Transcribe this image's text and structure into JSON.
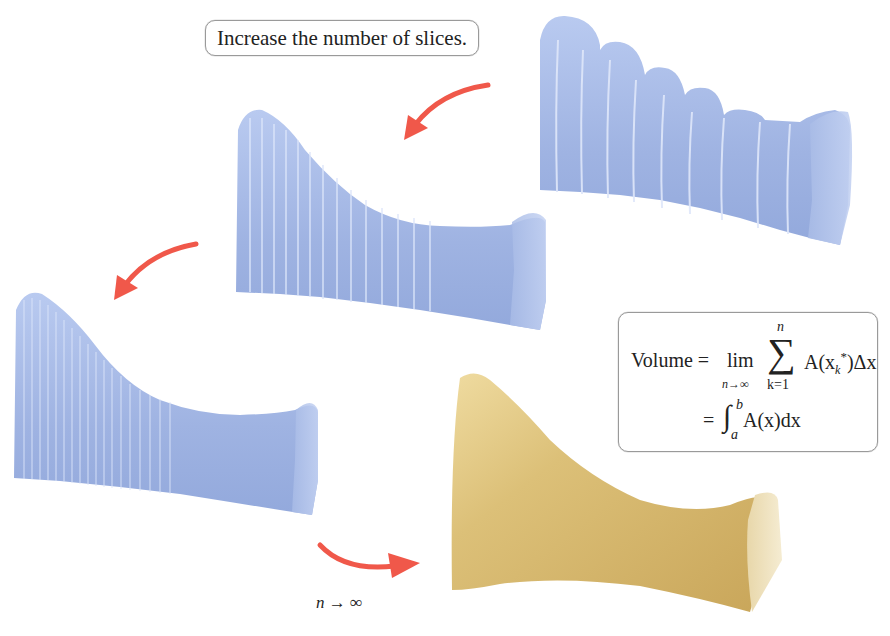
{
  "diagram": {
    "callout_top": {
      "text": "Increase the number of slices."
    },
    "formula": {
      "lhs": "Volume",
      "equals": "=",
      "lim": "lim",
      "lim_sub": "n→∞",
      "sigma": "∑",
      "sum_upper": "n",
      "sum_lower": "k=1",
      "summand": "A(x",
      "summand_sub": "k",
      "summand_sup": "*",
      "summand_tail": ")Δx",
      "line2_equals": "=",
      "integral": "∫",
      "int_upper": "b",
      "int_lower": "a",
      "integrand": "A(x)dx"
    },
    "limit_label": "n → ∞",
    "solids": [
      {
        "id": "solid-few-slices",
        "slices": 10,
        "color": "#a9bde8"
      },
      {
        "id": "solid-more-slices",
        "slices": 24,
        "color": "#a4b9e6"
      },
      {
        "id": "solid-many-slices",
        "slices": 40,
        "color": "#a1b6e4"
      },
      {
        "id": "solid-smooth",
        "slices": 0,
        "color": "#d9bb6e"
      }
    ],
    "arrow_color": "#f0584a"
  }
}
